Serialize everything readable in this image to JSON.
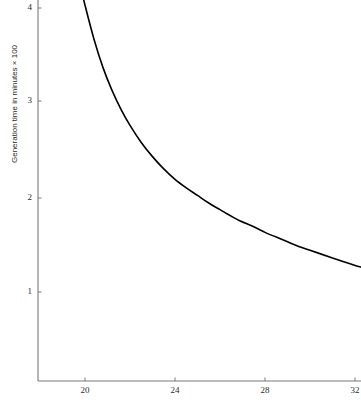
{
  "chart_data": {
    "type": "line",
    "title": "",
    "subtitle": "",
    "xlabel": "",
    "ylabel": "Generation time in minutes × 100",
    "xlim": [
      18.8,
      32.3
    ],
    "ylim": [
      0,
      4.25
    ],
    "xticks": [
      20,
      24,
      28,
      32
    ],
    "xtick_labels": [
      "20",
      "24",
      "28",
      "32"
    ],
    "yticks": [
      1,
      2,
      3,
      4
    ],
    "ytick_labels": [
      "1",
      "2",
      "3",
      "4"
    ],
    "grid": false,
    "legend": false,
    "legend_position": "none",
    "line_color": "#000000",
    "axis_color": "#7a7a7a",
    "background": "#ffffff",
    "series": [
      {
        "name": "generation time",
        "x": [
          19.78,
          20.0,
          20.4,
          20.8,
          21.2,
          21.6,
          22.0,
          22.5,
          23.0,
          23.5,
          24.0,
          24.5,
          25.0,
          25.5,
          26.0,
          26.5,
          26.9,
          27.5,
          28.0,
          28.5,
          29.0,
          29.5,
          30.0,
          30.5,
          31.0,
          31.5,
          32.0,
          32.31
        ],
        "y": [
          4.25,
          4.03,
          3.67,
          3.37,
          3.13,
          2.93,
          2.76,
          2.58,
          2.43,
          2.3,
          2.19,
          2.1,
          2.02,
          1.94,
          1.87,
          1.8,
          1.75,
          1.69,
          1.63,
          1.58,
          1.53,
          1.48,
          1.44,
          1.4,
          1.36,
          1.32,
          1.28,
          1.26
        ]
      }
    ],
    "annotations": []
  },
  "axes": {
    "x_tick_positions_px": [
      85,
      175,
      265,
      355
    ],
    "y_tick_positions_px": [
      292,
      198,
      101,
      8
    ],
    "x_axis_y_px": 381,
    "y_axis_x_px": 38,
    "plot_right_px": 361,
    "plot_top_px": 0
  }
}
